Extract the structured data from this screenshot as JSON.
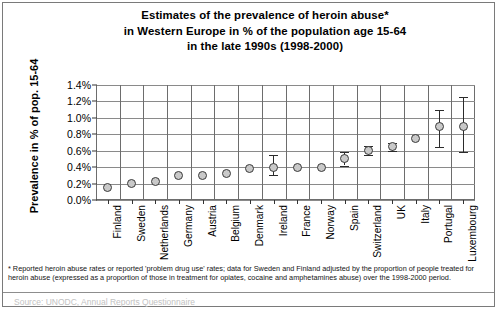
{
  "chart_data": {
    "type": "scatter",
    "title": "Estimates of the prevalence of heroin abuse* in Western Europe in % of the population age 15-64 in the late 1990s (1998-2000)",
    "title_lines": [
      "Estimates of the prevalence of heroin abuse*",
      "in Western Europe in % of the population age 15-64",
      "in the late 1990s (1998-2000)"
    ],
    "xlabel": "",
    "ylabel": "Prevalence in % of pop. 15-64",
    "ylim": [
      0.0,
      1.4
    ],
    "ytick_labels": [
      "1.4%",
      "1.2%",
      "1.0%",
      "0.8%",
      "0.6%",
      "0.4%",
      "0.2%",
      "0.0%"
    ],
    "ytick_values": [
      1.4,
      1.2,
      1.0,
      0.8,
      0.6,
      0.4,
      0.2,
      0.0
    ],
    "grid": true,
    "legend": "none",
    "categories": [
      "Finland",
      "Sweden",
      "Netherlands",
      "Germany",
      "Austria",
      "Belgium",
      "Denmark",
      "Ireland",
      "France",
      "Norway",
      "Spain",
      "Switzerland",
      "UK",
      "Italy",
      "Portugal",
      "Luxembourg"
    ],
    "values": [
      0.15,
      0.2,
      0.23,
      0.3,
      0.3,
      0.32,
      0.38,
      0.4,
      0.4,
      0.4,
      0.5,
      0.6,
      0.65,
      0.75,
      0.9,
      0.9
    ],
    "error_low": [
      null,
      null,
      null,
      null,
      null,
      null,
      null,
      0.3,
      null,
      null,
      0.42,
      0.55,
      0.6,
      null,
      0.65,
      0.58
    ],
    "error_high": [
      null,
      null,
      null,
      null,
      null,
      null,
      null,
      0.55,
      null,
      null,
      0.58,
      0.66,
      0.7,
      null,
      1.1,
      1.25
    ]
  },
  "footnote": "* Reported  heroin  abuse rates or reported  'problem drug use'  rates; data for Sweden and Finland adjusted by the proportion of people  treated for heroin abuse  (expressed as a proportion of those in treatment for opiates, cocaine and amphetamines abuse) over the 1998-2000 period.",
  "source_line": "Source: UNODC, Annual Reports Questionnaire"
}
